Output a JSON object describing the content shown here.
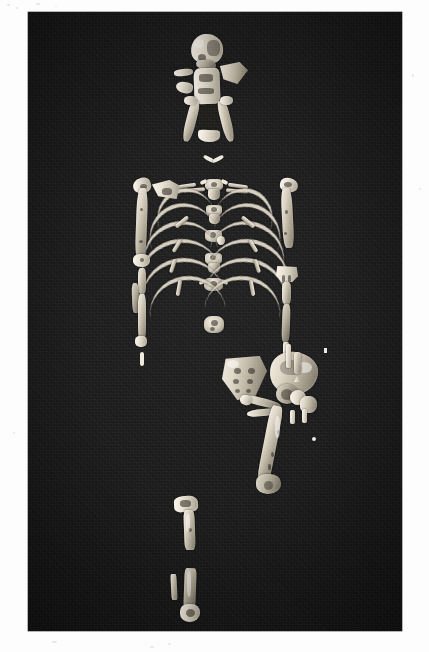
{
  "page": {
    "background_color": "#fdfdfd",
    "type": "photographic-plate"
  },
  "photo": {
    "frame": {
      "left": 28,
      "top": 12,
      "width": 374,
      "height": 619
    },
    "background_color": "#1a1a1a",
    "subject": "fossil hominid partial skeleton laid out in anatomical position on dark cloth",
    "lighting": "overhead flat studio light",
    "medium": "black and white photograph"
  },
  "specimen": {
    "regions": [
      {
        "name": "cranium",
        "label": "cranial vault fragments"
      },
      {
        "name": "mandible",
        "label": "mandible"
      },
      {
        "name": "clavicles",
        "label": "clavicle fragments"
      },
      {
        "name": "vertebral-column",
        "label": "vertebrae"
      },
      {
        "name": "ribs",
        "label": "rib fragments"
      },
      {
        "name": "left-arm",
        "label": "left humerus, radius and ulna"
      },
      {
        "name": "right-arm",
        "label": "right humerus, ulna and radius"
      },
      {
        "name": "scapula",
        "label": "scapula fragment"
      },
      {
        "name": "sacrum",
        "label": "sacrum"
      },
      {
        "name": "innominate",
        "label": "innominate / hip bone"
      },
      {
        "name": "femur",
        "label": "left femur"
      },
      {
        "name": "tibia",
        "label": "tibia fragments"
      },
      {
        "name": "fibula",
        "label": "fibula fragment"
      },
      {
        "name": "hand-fragments",
        "label": "hand and foot fragments"
      }
    ],
    "bone_tone": "#ded6c6",
    "bone_highlight": "#f6f1e6",
    "bone_shadow": "#6f6a5c"
  },
  "counts": {
    "rib_arcs_left": 6,
    "rib_arcs_right": 6,
    "vertebrae_visible": 8
  }
}
